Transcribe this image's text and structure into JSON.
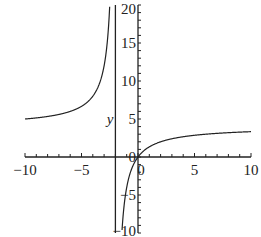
{
  "chart_data": {
    "type": "line",
    "title": "",
    "xlabel": "",
    "ylabel": "y",
    "xlim": [
      -10,
      10
    ],
    "ylim": [
      -10,
      20
    ],
    "grid": false,
    "legend": null,
    "function": "y = 4x/(x+2)",
    "vertical_asymptote": -2,
    "horizontal_asymptote": 4,
    "x_ticks": [
      -10,
      -5,
      0,
      5,
      10
    ],
    "x_tick_labels": [
      "−10",
      "−5",
      "0",
      "5",
      "10"
    ],
    "y_ticks": [
      20,
      15,
      10,
      5,
      0,
      -5,
      -10
    ],
    "y_tick_labels": [
      "20",
      "15",
      "10",
      "5",
      "0",
      "−5",
      "−10"
    ],
    "series": [
      {
        "name": "left branch",
        "x": [
          -10,
          -8,
          -6,
          -5,
          -4,
          -3,
          -2.5,
          -2.4,
          -2.35
        ],
        "y": [
          5,
          5.33,
          6,
          6.67,
          8,
          12,
          20,
          24,
          26.9
        ]
      },
      {
        "name": "right branch",
        "x": [
          -1.48,
          -1.4,
          -1.2,
          -1,
          -0.5,
          0,
          1,
          2,
          5,
          10
        ],
        "y": [
          -11.4,
          -9.33,
          -6,
          -4,
          -1.33,
          0,
          1.33,
          2,
          2.86,
          3.33
        ]
      }
    ]
  },
  "labels": {
    "y_axis": "y",
    "origin_x": "0",
    "origin_y": "0"
  }
}
